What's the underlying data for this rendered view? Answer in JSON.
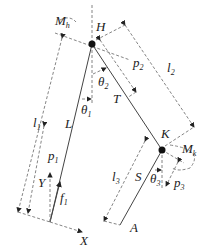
{
  "diagram": {
    "title": "",
    "labels": {
      "hip_moment": {
        "main": "M",
        "sub": "h"
      },
      "hip": {
        "main": "H"
      },
      "knee": {
        "main": "K"
      },
      "knee_moment": {
        "main": "M",
        "sub": "k"
      },
      "thigh_len": {
        "main": "l",
        "sub": "2"
      },
      "shank_len": {
        "main": "l",
        "sub": "3"
      },
      "trunk_len": {
        "main": "l",
        "sub": "1"
      },
      "p1": {
        "main": "p",
        "sub": "1"
      },
      "p2": {
        "main": "p",
        "sub": "2"
      },
      "p3": {
        "main": "p",
        "sub": "3"
      },
      "theta1": {
        "main": "θ",
        "sub": "1"
      },
      "theta2": {
        "main": "θ",
        "sub": "2"
      },
      "theta3": {
        "main": "θ",
        "sub": "3"
      },
      "L": {
        "main": "L"
      },
      "T": {
        "main": "T"
      },
      "S": {
        "main": "S"
      },
      "A": {
        "main": "A"
      },
      "f1": {
        "main": "f",
        "sub": "1"
      },
      "X": {
        "main": "X"
      },
      "Y": {
        "main": "Y"
      }
    }
  }
}
